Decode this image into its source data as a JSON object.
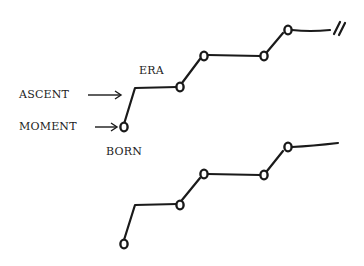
{
  "labels": {
    "era": "ERA",
    "ascent": "ASCENT",
    "moment": "MOMENT",
    "born": "BORN"
  },
  "diagram": {
    "top_timeline": {
      "start_node": "born/moment",
      "nodes": 5,
      "ends_with": "break-marks"
    },
    "bottom_timeline": {
      "nodes": 5,
      "ends_with": "open-line"
    },
    "colors": {
      "ink": "#1a1a1a",
      "background": "#ffffff"
    }
  }
}
